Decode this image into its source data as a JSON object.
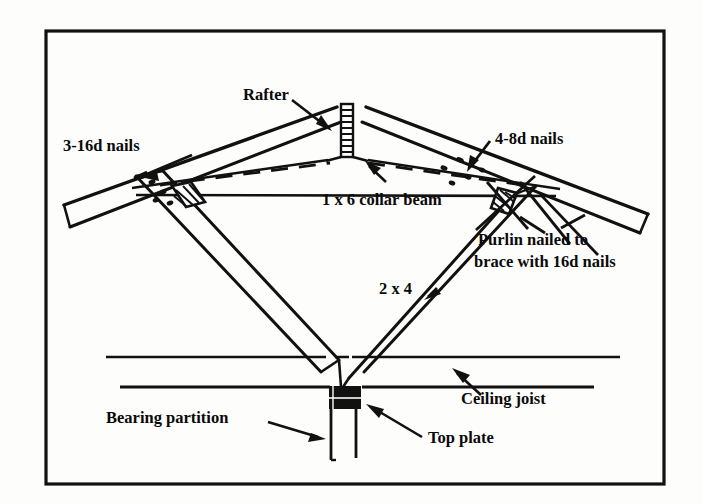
{
  "figure": {
    "frame_color": "#111111",
    "background_color": "#fdfdfc",
    "line_color": "#111111",
    "width": 703,
    "height": 504
  },
  "labels": {
    "rafter": "Rafter",
    "nails_left": "3-16d nails",
    "nails_right": "4-8d nails",
    "collar_beam": "1 x 6 collar beam",
    "purlin_line1": "Purlin nailed to",
    "purlin_line2": "brace with 16d nails",
    "brace_size": "2 x 4",
    "ceiling_joist": "Ceiling joist",
    "bearing_partition": "Bearing partition",
    "top_plate": "Top plate"
  },
  "icons": {
    "leader_arrow": "arrow-leader-icon",
    "ridge_board": "hatched-ridge-board-icon",
    "purlin_block_left": "hatched-purlin-block-icon",
    "purlin_block_right": "hatched-purlin-block-icon",
    "top_plate_block": "solid-top-plate-block-icon"
  }
}
